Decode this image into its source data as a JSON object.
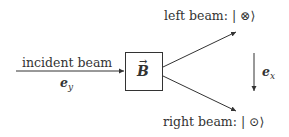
{
  "diagram": {
    "incident": {
      "label": "incident beam",
      "vector": "e",
      "vector_sub": "y"
    },
    "box": {
      "symbol": "B"
    },
    "left_beam": {
      "label": "left beam: ",
      "ket": "| ⊗⟩"
    },
    "right_beam": {
      "label": "right beam: ",
      "ket": "| ⊙⟩"
    },
    "axis": {
      "vector": "e",
      "vector_sub": "x"
    },
    "colors": {
      "stroke": "#333333",
      "background": "#ffffff"
    }
  }
}
